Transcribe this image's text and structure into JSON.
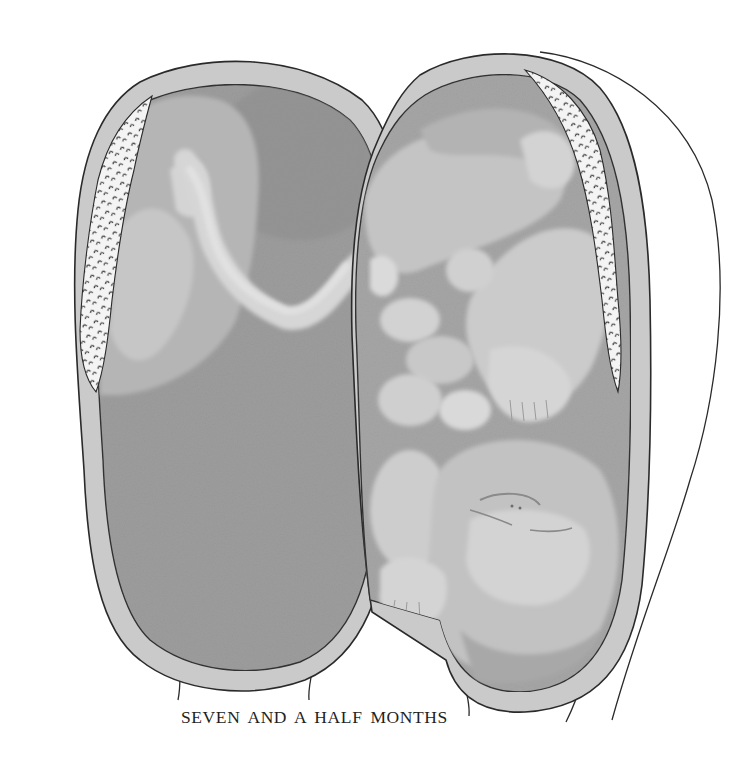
{
  "figure": {
    "caption": "SEVEN AND A HALF MONTHS",
    "parts": {
      "left_half": "opened-uterine-wall-with-placenta-and-umbilical-cord",
      "right_half": "opened-uterine-wall-with-folded-fetus"
    },
    "colors": {
      "background": "#ffffff",
      "wall": "#c9c9c9",
      "cavity": "#9c9c9c",
      "placenta": "#b6b6b6",
      "cord": "#d8d8d8",
      "fetus_light": "#d2d2d2",
      "fetus_mid": "#b9b9b9",
      "fetus_dark": "#a4a4a4",
      "outline": "#2a2a2a",
      "caption_text": "#1f1f1f"
    }
  }
}
